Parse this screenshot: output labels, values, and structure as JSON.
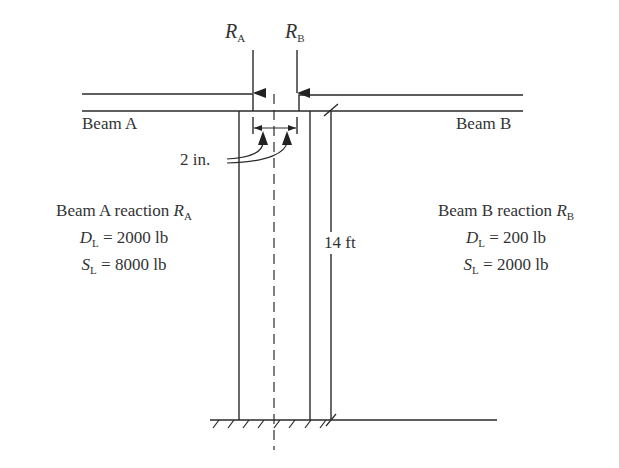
{
  "reactions": {
    "ra": {
      "symbol": "R",
      "sub": "A"
    },
    "rb": {
      "symbol": "R",
      "sub": "B"
    }
  },
  "beams": {
    "a_label": "Beam A",
    "b_label": "Beam B"
  },
  "dimensions": {
    "offset": "2 in.",
    "height": "14 ft"
  },
  "beam_a_reaction": {
    "title": "Beam A reaction",
    "symbol": "R",
    "sub": "A",
    "dead": {
      "symbol": "D",
      "sub": "L",
      "value": "= 2000 lb"
    },
    "snow": {
      "symbol": "S",
      "sub": "L",
      "value": "= 8000 lb"
    }
  },
  "beam_b_reaction": {
    "title": "Beam B reaction",
    "symbol": "R",
    "sub": "B",
    "dead": {
      "symbol": "D",
      "sub": "L",
      "value": "= 200 lb"
    },
    "snow": {
      "symbol": "S",
      "sub": "L",
      "value": "= 2000 lb"
    }
  }
}
